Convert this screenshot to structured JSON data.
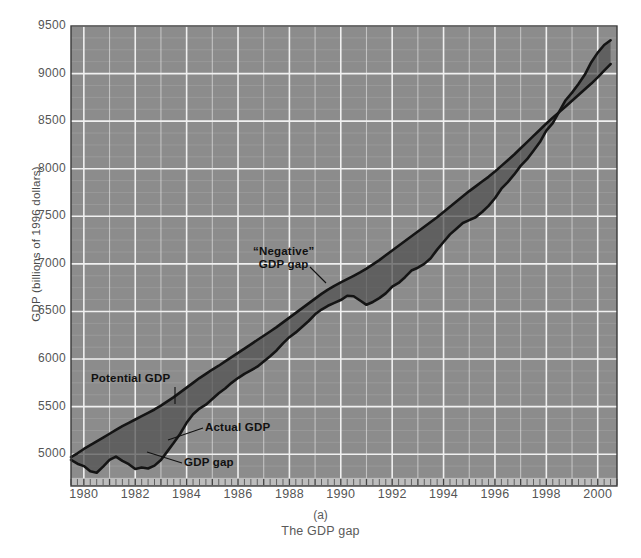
{
  "figure": {
    "caption_letter": "(a)",
    "caption_text": "The GDP gap",
    "y_axis_title": "GDP (billions of 1996 dollars)"
  },
  "annotations": {
    "negative_gap_line1": "“Negative”",
    "negative_gap_line2": "GDP gap",
    "potential_gdp": "Potential GDP",
    "actual_gdp": "Actual GDP",
    "gdp_gap": "GDP gap"
  },
  "colors": {
    "plot_background": "#8c8c8c",
    "major_gridline": "#f0f0f0",
    "minor_gridline": "#9e9e9e",
    "gap_fill": "#4f4f4f",
    "line_stroke": "#141414",
    "tick_band": "#bdbdbd",
    "label_text": "#555555",
    "annotation_text": "#111111"
  },
  "chart_data": {
    "type": "area",
    "title": "The GDP gap",
    "xlabel": "",
    "ylabel": "GDP (billions of 1996 dollars)",
    "xlim": [
      1979.5,
      2000.75
    ],
    "ylim": [
      4750,
      9500
    ],
    "grid": true,
    "legend": "none",
    "y_ticks": [
      5000,
      5500,
      6000,
      6500,
      7000,
      7500,
      8000,
      8500,
      9000,
      9500
    ],
    "y_minor_step": 125,
    "x_ticks": [
      1980,
      1982,
      1984,
      1986,
      1988,
      1990,
      1992,
      1994,
      1996,
      1998,
      2000
    ],
    "x_minor_step": 0.25,
    "series": [
      {
        "name": "Potential GDP",
        "x": [
          1979.5,
          1979.75,
          1980.0,
          1980.25,
          1980.5,
          1980.75,
          1981.0,
          1981.25,
          1981.5,
          1981.75,
          1982.0,
          1982.25,
          1982.5,
          1982.75,
          1983.0,
          1983.25,
          1983.5,
          1983.75,
          1984.0,
          1984.25,
          1984.5,
          1984.75,
          1985.0,
          1985.25,
          1985.5,
          1985.75,
          1986.0,
          1986.25,
          1986.5,
          1986.75,
          1987.0,
          1987.25,
          1987.5,
          1987.75,
          1988.0,
          1988.25,
          1988.5,
          1988.75,
          1989.0,
          1989.25,
          1989.5,
          1989.75,
          1990.0,
          1990.25,
          1990.5,
          1990.75,
          1991.0,
          1991.25,
          1991.5,
          1991.75,
          1992.0,
          1992.25,
          1992.5,
          1992.75,
          1993.0,
          1993.25,
          1993.5,
          1993.75,
          1994.0,
          1994.25,
          1994.5,
          1994.75,
          1995.0,
          1995.25,
          1995.5,
          1995.75,
          1996.0,
          1996.25,
          1996.5,
          1996.75,
          1997.0,
          1997.25,
          1997.5,
          1997.75,
          1998.0,
          1998.25,
          1998.5,
          1998.75,
          1999.0,
          1999.25,
          1999.5,
          1999.75,
          2000.0,
          2000.25,
          2000.5
        ],
        "y": [
          4970,
          5010,
          5055,
          5095,
          5135,
          5175,
          5215,
          5255,
          5295,
          5330,
          5365,
          5400,
          5435,
          5470,
          5510,
          5555,
          5600,
          5650,
          5700,
          5750,
          5800,
          5845,
          5890,
          5930,
          5975,
          6020,
          6065,
          6110,
          6155,
          6200,
          6245,
          6290,
          6335,
          6385,
          6435,
          6485,
          6535,
          6585,
          6635,
          6685,
          6730,
          6770,
          6805,
          6840,
          6875,
          6910,
          6950,
          6995,
          7040,
          7090,
          7140,
          7190,
          7240,
          7290,
          7340,
          7390,
          7440,
          7490,
          7545,
          7600,
          7655,
          7710,
          7765,
          7815,
          7865,
          7915,
          7970,
          8030,
          8090,
          8150,
          8215,
          8280,
          8345,
          8410,
          8475,
          8535,
          8595,
          8655,
          8715,
          8775,
          8835,
          8895,
          8960,
          9030,
          9100
        ]
      },
      {
        "name": "Actual GDP",
        "x": [
          1979.5,
          1979.75,
          1980.0,
          1980.25,
          1980.5,
          1980.75,
          1981.0,
          1981.25,
          1981.5,
          1981.75,
          1982.0,
          1982.25,
          1982.5,
          1982.75,
          1983.0,
          1983.25,
          1983.5,
          1983.75,
          1984.0,
          1984.25,
          1984.5,
          1984.75,
          1985.0,
          1985.25,
          1985.5,
          1985.75,
          1986.0,
          1986.25,
          1986.5,
          1986.75,
          1987.0,
          1987.25,
          1987.5,
          1987.75,
          1988.0,
          1988.25,
          1988.5,
          1988.75,
          1989.0,
          1989.25,
          1989.5,
          1989.75,
          1990.0,
          1990.25,
          1990.5,
          1990.75,
          1991.0,
          1991.25,
          1991.5,
          1991.75,
          1992.0,
          1992.25,
          1992.5,
          1992.75,
          1993.0,
          1993.25,
          1993.5,
          1993.75,
          1994.0,
          1994.25,
          1994.5,
          1994.75,
          1995.0,
          1995.25,
          1995.5,
          1995.75,
          1996.0,
          1996.25,
          1996.5,
          1996.75,
          1997.0,
          1997.25,
          1997.5,
          1997.75,
          1998.0,
          1998.25,
          1998.5,
          1998.75,
          1999.0,
          1999.25,
          1999.5,
          1999.75,
          2000.0,
          2000.25,
          2000.5
        ],
        "y": [
          4940,
          4900,
          4875,
          4820,
          4805,
          4870,
          4940,
          4975,
          4930,
          4895,
          4845,
          4860,
          4850,
          4880,
          4940,
          5030,
          5120,
          5215,
          5330,
          5420,
          5480,
          5520,
          5580,
          5640,
          5690,
          5750,
          5800,
          5845,
          5880,
          5920,
          5975,
          6030,
          6090,
          6165,
          6230,
          6280,
          6340,
          6400,
          6470,
          6520,
          6560,
          6590,
          6620,
          6665,
          6660,
          6615,
          6570,
          6600,
          6640,
          6690,
          6760,
          6800,
          6860,
          6930,
          6960,
          7000,
          7060,
          7150,
          7230,
          7310,
          7370,
          7430,
          7460,
          7490,
          7545,
          7610,
          7690,
          7790,
          7860,
          7940,
          8030,
          8100,
          8190,
          8280,
          8400,
          8480,
          8600,
          8720,
          8800,
          8890,
          8990,
          9120,
          9220,
          9300,
          9350
        ]
      }
    ],
    "annotations": [
      {
        "text": "“Negative” GDP gap",
        "x": 1988.6,
        "y": 7080
      },
      {
        "text": "Potential GDP",
        "x": 1981.4,
        "y": 5900
      },
      {
        "text": "Actual GDP",
        "x": 1985.1,
        "y": 5380
      },
      {
        "text": "GDP gap",
        "x": 1984.2,
        "y": 4990
      }
    ]
  }
}
